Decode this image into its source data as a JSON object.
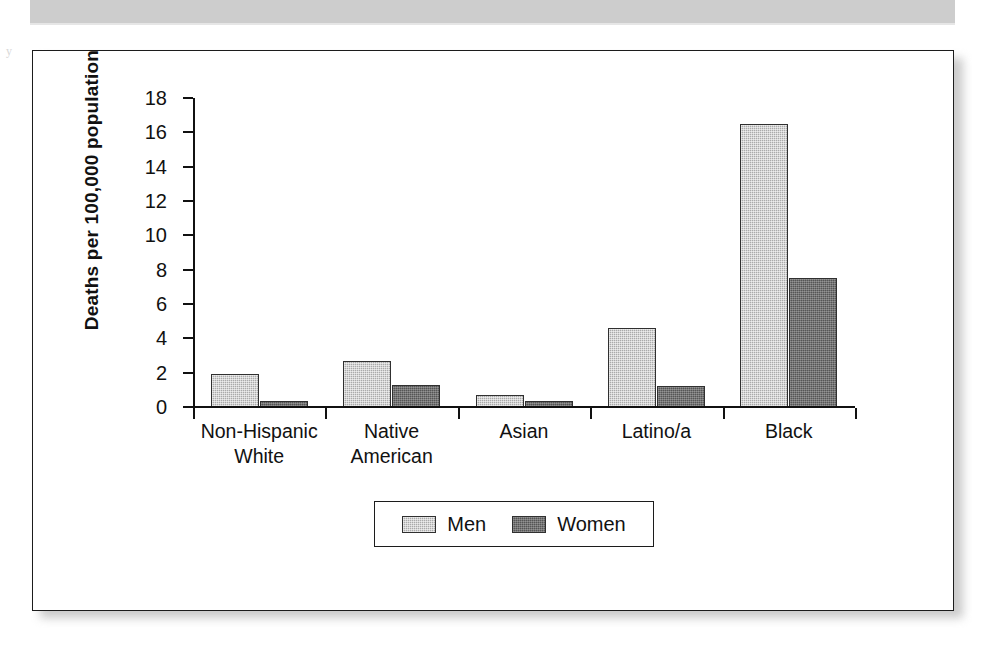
{
  "page": {
    "side_mark": "y",
    "header_band_color": "#cdcdcd",
    "frame_border_color": "#1c1c1c"
  },
  "chart_data": {
    "type": "bar",
    "title": "",
    "xlabel": "",
    "ylabel": "Deaths per 100,000 population",
    "ylim": [
      0,
      18
    ],
    "ytick_step": 2,
    "yticks": [
      18,
      16,
      14,
      12,
      10,
      8,
      6,
      4,
      2,
      0
    ],
    "grid": false,
    "legend_position": "bottom-center",
    "categories": [
      "Non-Hispanic White",
      "Native American",
      "Asian",
      "Latino/a",
      "Black"
    ],
    "category_lines": [
      [
        "Non-Hispanic",
        "White"
      ],
      [
        "Native",
        "American"
      ],
      [
        "Asian",
        ""
      ],
      [
        "Latino/a",
        ""
      ],
      [
        "Black",
        ""
      ]
    ],
    "series": [
      {
        "name": "Men",
        "color": "#aaaaaa",
        "values": [
          1.9,
          2.7,
          0.7,
          4.6,
          16.5
        ]
      },
      {
        "name": "Women",
        "color": "#555555",
        "values": [
          0.35,
          1.3,
          0.35,
          1.2,
          7.5
        ]
      }
    ]
  }
}
